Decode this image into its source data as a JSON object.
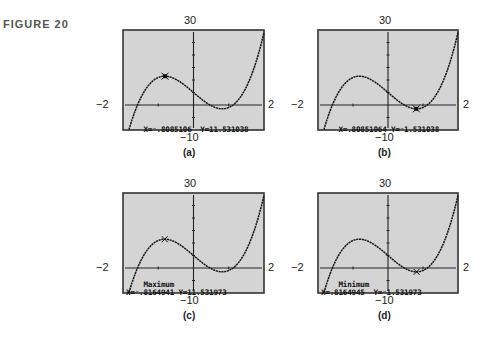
{
  "figure_label": "FIGURE 20",
  "chart_data": [
    {
      "type": "line",
      "panel": "a",
      "caption": "(a)",
      "function": "y = 6x^3 - 12x + 5",
      "window": {
        "xmin": -2,
        "xmax": 2,
        "ymin": -10,
        "ymax": 30,
        "xscl": 1,
        "yscl": 5
      },
      "axis_labels": {
        "left": "−2",
        "right": "2",
        "top": "30",
        "bottom": "−10"
      },
      "cursor": {
        "x": -0.8085106,
        "y": 11.531038,
        "marker": "trace"
      },
      "screen_lines": [
        "X=⁻.8085106  Y=11.531038"
      ],
      "readout": {
        "x_text": "X=⁻.8085106",
        "y_text": "Y=11.531038"
      }
    },
    {
      "type": "line",
      "panel": "b",
      "caption": "(b)",
      "function": "y = 6x^3 - 12x + 5",
      "window": {
        "xmin": -2,
        "xmax": 2,
        "ymin": -10,
        "ymax": 30,
        "xscl": 1,
        "yscl": 5
      },
      "axis_labels": {
        "left": "−2",
        "right": "2",
        "top": "30",
        "bottom": "−10"
      },
      "cursor": {
        "x": 0.80851064,
        "y": -1.531038,
        "marker": "trace"
      },
      "readout": {
        "x_text": "X=.80851064",
        "y_text": "Y=⁻1.531038"
      }
    },
    {
      "type": "line",
      "panel": "c",
      "caption": "(c)",
      "function": "y = 6x^3 - 12x + 5",
      "window": {
        "xmin": -2,
        "xmax": 2,
        "ymin": -10,
        "ymax": 30,
        "xscl": 1,
        "yscl": 5
      },
      "axis_labels": {
        "left": "−2",
        "right": "2",
        "top": "30",
        "bottom": "−10"
      },
      "cursor": {
        "x": -0.8164941,
        "y": 11.531973,
        "marker": "calc"
      },
      "readout": {
        "title": "Maximum",
        "x_text": "X=⁻.8164941",
        "y_text": "Y=11.531973"
      }
    },
    {
      "type": "line",
      "panel": "d",
      "caption": "(d)",
      "function": "y = 6x^3 - 12x + 5",
      "window": {
        "xmin": -2,
        "xmax": 2,
        "ymin": -10,
        "ymax": 30,
        "xscl": 1,
        "yscl": 5
      },
      "axis_labels": {
        "left": "−2",
        "right": "2",
        "top": "30",
        "bottom": "−10"
      },
      "cursor": {
        "x": 0.8164945,
        "y": -1.531973,
        "marker": "calc"
      },
      "readout": {
        "title": "Minimum",
        "x_text": "X=.8164945",
        "y_text": "Y=⁻1.531973"
      }
    }
  ],
  "colors": {
    "screen_bg": "#d4d4d4",
    "screen_border": "#333333",
    "curve": "#1a1a1a"
  }
}
